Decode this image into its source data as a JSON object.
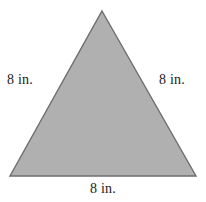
{
  "figure": {
    "name": "equilateral-triangle-with-side-labels",
    "shape_type": "triangle",
    "background_color": "#ffffff",
    "fill_color": "#b0b0b0",
    "stroke_color": "#6e6e6e",
    "vertices": {
      "apex": [
        102,
        11
      ],
      "bottom_left": [
        10,
        176
      ],
      "bottom_right": [
        196,
        176
      ]
    },
    "labels": {
      "left": "8 in.",
      "right": "8 in.",
      "bottom": "8 in."
    }
  }
}
